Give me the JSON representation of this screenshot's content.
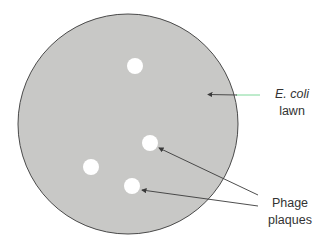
{
  "diagram": {
    "plate": {
      "cx": 128,
      "cy": 124,
      "r": 110,
      "fill": "#c8c8c6",
      "stroke": "#4a4a4a"
    },
    "plaques": [
      {
        "cx": 135,
        "cy": 66,
        "r": 8
      },
      {
        "cx": 150,
        "cy": 143,
        "r": 8
      },
      {
        "cx": 91,
        "cy": 167,
        "r": 8
      },
      {
        "cx": 132,
        "cy": 186,
        "r": 8
      }
    ],
    "labels": {
      "ecoli_line1": "E. coli",
      "ecoli_line2": "lawn",
      "phage_line1": "Phage",
      "phage_line2": "plaques"
    },
    "colors": {
      "lawn": "#c8c8c6",
      "plaque": "#ffffff",
      "text": "#333333",
      "arrow": "#3a3a3a",
      "leader_green": "#7fd89a"
    }
  }
}
